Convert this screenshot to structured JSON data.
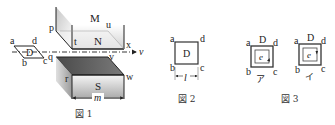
{
  "figure1": {
    "caption": "図 1",
    "loop_labels": {
      "a": "a",
      "b": "b",
      "c": "c",
      "d": "d",
      "D": "D"
    },
    "magnet_top": {
      "label_M": "M",
      "label_N": "N",
      "corners": {
        "p": "p",
        "t": "t",
        "u": "u",
        "x": "x"
      }
    },
    "magnet_bottom": {
      "label_S": "S",
      "corners": {
        "q": "q",
        "r": "r",
        "v": "v",
        "w": "w"
      }
    },
    "width_label": "m",
    "velocity_label": "v"
  },
  "figure2": {
    "caption": "図 2",
    "labels": {
      "a": "a",
      "b": "b",
      "c": "c",
      "d": "d",
      "D": "D"
    },
    "side_label": "l"
  },
  "figure3": {
    "caption": "図 3",
    "options": [
      {
        "id": "ア",
        "label": "ア",
        "emf": "e",
        "corners": {
          "a": "a",
          "b": "b",
          "c": "c",
          "d": "d"
        },
        "title": "D",
        "direction": "counterclockwise"
      },
      {
        "id": "イ",
        "label": "イ",
        "emf": "e",
        "corners": {
          "a": "a",
          "b": "b",
          "c": "c",
          "d": "d"
        },
        "title": "D",
        "direction": "clockwise"
      }
    ]
  }
}
